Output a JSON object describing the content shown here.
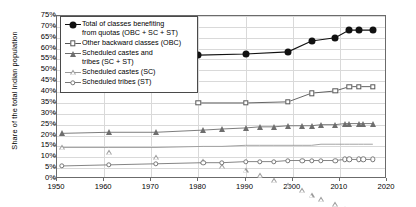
{
  "chart": {
    "type": "line",
    "ylabel": "Share of the total Indian population",
    "xlabel": ""
  },
  "axes": {
    "y_ticks": [
      "0%",
      "5%",
      "10%",
      "15%",
      "20%",
      "25%",
      "30%",
      "35%",
      "40%",
      "45%",
      "50%",
      "55%",
      "60%",
      "65%",
      "70%",
      "75%"
    ],
    "y_values": [
      0,
      5,
      10,
      15,
      20,
      25,
      30,
      35,
      40,
      45,
      50,
      55,
      60,
      65,
      70,
      75
    ],
    "x_ticks": [
      "1950",
      "1960",
      "1970",
      "1980",
      "1990",
      "2000",
      "2010",
      "2020"
    ],
    "x_values": [
      1950,
      1960,
      1970,
      1980,
      1990,
      2000,
      2010,
      2020
    ],
    "xlim": [
      1950,
      2020
    ],
    "ylim": [
      0,
      75
    ],
    "grid": true
  },
  "legend": {
    "position": "top-left-inside",
    "items": [
      {
        "label": "Total of classes benefiting\nfrom quotas (OBC + SC + ST)",
        "marker": "circle-filled",
        "color": "#111111"
      },
      {
        "label": "Other backward classes (OBC)",
        "marker": "square-open",
        "color": "#555555"
      },
      {
        "label": "Scheduled castes and\ntribes (SC + ST)",
        "marker": "triangle-filled",
        "color": "#6e6e6e"
      },
      {
        "label": "Scheduled castes (SC)",
        "marker": "triangle-open",
        "color": "#9a9a9a"
      },
      {
        "label": "Scheduled tribes (ST)",
        "marker": "circle-open",
        "color": "#777777"
      }
    ]
  },
  "chart_data": {
    "type": "line",
    "title": "",
    "xlabel": "",
    "ylabel": "Share of the total Indian population",
    "xlim": [
      1950,
      2020
    ],
    "ylim": [
      0,
      75
    ],
    "grid": true,
    "legend_position": "top-left-inside",
    "series": [
      {
        "name": "Total of classes benefiting from quotas (OBC + SC + ST)",
        "marker": "circle-filled",
        "color": "#111111",
        "x": [
          1980,
          1990,
          1999,
          2004,
          2009,
          2012,
          2014,
          2017
        ],
        "values": [
          57.0,
          57.5,
          58.5,
          63.5,
          65.0,
          68.5,
          68.5,
          68.5
        ]
      },
      {
        "name": "Other backward classes (OBC)",
        "marker": "square-open",
        "color": "#555555",
        "x": [
          1980,
          1990,
          1999,
          2004,
          2009,
          2012,
          2014,
          2017
        ],
        "values": [
          35.0,
          35.0,
          35.5,
          39.5,
          40.5,
          42.5,
          42.5,
          42.5
        ]
      },
      {
        "name": "Scheduled castes and tribes (SC + ST)",
        "marker": "triangle-filled",
        "color": "#6e6e6e",
        "x": [
          1951,
          1961,
          1971,
          1981,
          1985,
          1990,
          1993,
          1996,
          1999,
          2002,
          2004,
          2006,
          2009,
          2011,
          2012,
          2014,
          2015,
          2017
        ],
        "values": [
          21.0,
          21.5,
          21.5,
          22.5,
          23.0,
          23.5,
          24.0,
          24.0,
          24.5,
          24.5,
          24.5,
          25.0,
          25.0,
          25.5,
          25.5,
          25.5,
          25.5,
          25.5
        ]
      },
      {
        "name": "Scheduled castes (SC)",
        "marker": "triangle-open",
        "color": "#9a9a9a",
        "x": [
          1951,
          1961,
          1971,
          1981,
          1985,
          1990,
          1993,
          1996,
          1999,
          2002,
          2004,
          2006,
          2009,
          2011,
          2012,
          2014,
          2015,
          2017
        ],
        "values": [
          14.5,
          14.5,
          14.5,
          15.0,
          15.0,
          15.5,
          15.5,
          15.5,
          15.5,
          15.5,
          15.5,
          16.0,
          16.0,
          16.0,
          16.0,
          16.0,
          16.0,
          16.0
        ]
      },
      {
        "name": "Scheduled tribes (ST)",
        "marker": "circle-open",
        "color": "#777777",
        "x": [
          1951,
          1961,
          1971,
          1981,
          1985,
          1990,
          1993,
          1996,
          1999,
          2002,
          2004,
          2006,
          2009,
          2011,
          2012,
          2014,
          2015,
          2017
        ],
        "values": [
          6.0,
          6.5,
          7.0,
          7.5,
          7.5,
          8.0,
          8.0,
          8.0,
          8.5,
          8.5,
          8.5,
          8.5,
          8.5,
          9.0,
          9.0,
          9.0,
          9.0,
          9.0
        ]
      }
    ]
  }
}
